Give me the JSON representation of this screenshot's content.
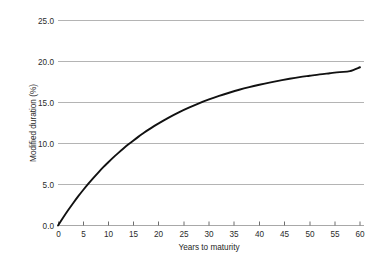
{
  "chart_data": {
    "type": "line",
    "title": "",
    "subtitle": "",
    "xlabel": "Years to maturity",
    "ylabel": "Modified duration (%)",
    "xlim": [
      0,
      60
    ],
    "ylim": [
      0.0,
      25.0
    ],
    "xticks": [
      0,
      5,
      10,
      15,
      20,
      25,
      30,
      35,
      40,
      45,
      50,
      55,
      60
    ],
    "xticklabels": [
      "0",
      "5",
      "10",
      "15",
      "20",
      "25",
      "30",
      "35",
      "40",
      "45",
      "50",
      "55",
      "60"
    ],
    "yticks": [
      0.0,
      5.0,
      10.0,
      15.0,
      20.0,
      25.0
    ],
    "yticklabels": [
      "0.0",
      "5.0",
      "10.0",
      "15.0",
      "20.0",
      "25.0"
    ],
    "grid": {
      "horizontal": true,
      "vertical": false,
      "color": "#b4b4b4"
    },
    "legend": {
      "visible": false,
      "position": "none",
      "entries": []
    },
    "annotations": [],
    "series": [
      {
        "name": "Modified duration",
        "color": "#111111",
        "linewidth": 1.9,
        "marker": "none",
        "x": [
          0,
          1,
          2,
          3,
          4,
          5,
          6,
          7,
          8,
          9,
          10,
          11,
          12,
          13,
          14,
          15,
          16,
          17,
          18,
          19,
          20,
          22,
          24,
          26,
          28,
          30,
          32,
          34,
          36,
          38,
          40,
          42,
          44,
          46,
          48,
          50,
          52,
          54,
          56,
          58,
          60
        ],
        "values": [
          0.0,
          0.95,
          1.86,
          2.72,
          3.55,
          4.33,
          5.08,
          5.79,
          6.46,
          7.11,
          7.72,
          8.31,
          8.86,
          9.39,
          9.9,
          10.38,
          10.84,
          11.27,
          11.69,
          12.09,
          12.46,
          13.16,
          13.8,
          14.37,
          14.9,
          15.37,
          15.8,
          16.19,
          16.55,
          16.87,
          17.16,
          17.43,
          17.67,
          17.89,
          18.09,
          18.26,
          18.43,
          18.57,
          18.71,
          18.83,
          19.3
        ]
      }
    ],
    "reference_points": [
      {
        "x": 0,
        "y": 0.0
      },
      {
        "x": 5.8,
        "y": 5.0
      },
      {
        "x": 14.0,
        "y": 10.0
      },
      {
        "x": 29.0,
        "y": 15.0
      },
      {
        "x": 60.0,
        "y": 19.3
      }
    ]
  },
  "axes": {
    "y_axis_title": "Modified duration (%)",
    "x_axis_title": "Years to maturity",
    "y_labels": [
      "25.0",
      "20.0",
      "15.0",
      "10.0",
      "5.0",
      "0.0"
    ],
    "x_labels": [
      "0",
      "5",
      "10",
      "15",
      "20",
      "25",
      "30",
      "35",
      "40",
      "45",
      "50",
      "55",
      "60"
    ]
  },
  "colors": {
    "background": "#ffffff",
    "curve": "#111111",
    "gridline": "#b4b4b4",
    "baseline": "#a8a8a8",
    "text": "#1f1f1f"
  }
}
